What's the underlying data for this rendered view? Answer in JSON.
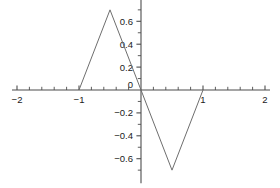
{
  "chart_data": {
    "type": "line",
    "title": "",
    "subtitle": "",
    "xlabel": "",
    "ylabel": "",
    "xlim": [
      -2,
      2
    ],
    "ylim": [
      -0.78,
      0.78
    ],
    "grid": false,
    "legend": null,
    "axis_color": "#4d4d4d",
    "line_color": "#6e6e6e",
    "background": "#ffffff",
    "xticks_major": [
      -2,
      -1,
      0,
      1,
      2
    ],
    "xtick_labels": [
      "-2",
      "-1",
      "0",
      "1",
      "2"
    ],
    "xticks_minor": [
      -1.8,
      -1.6,
      -1.4,
      -1.2,
      -0.8,
      -0.6,
      -0.4,
      -0.2,
      0.2,
      0.4,
      0.6,
      0.8,
      1.2,
      1.4,
      1.6,
      1.8
    ],
    "yticks_major": [
      0.6,
      0.4,
      0.2,
      -0.2,
      -0.4,
      -0.6
    ],
    "ytick_labels": [
      "0.6",
      "0.4",
      "0.2",
      "-0.2",
      "-0.4",
      "-0.6"
    ],
    "yticks_minor": [
      0.7,
      0.5,
      0.3,
      0.1,
      -0.1,
      -0.3,
      -0.5,
      -0.7
    ],
    "origin_label": "0",
    "series": [
      {
        "name": "triangle-wave",
        "x": [
          -2,
          -1,
          -0.5,
          0,
          0.5,
          1,
          2
        ],
        "y": [
          0,
          0,
          0.7,
          0,
          -0.7,
          0,
          0
        ],
        "visible_x": [
          -1,
          -0.5,
          0,
          0.5,
          1
        ],
        "visible_y": [
          0,
          0.7,
          0,
          -0.7,
          0
        ]
      }
    ],
    "annotations": []
  }
}
